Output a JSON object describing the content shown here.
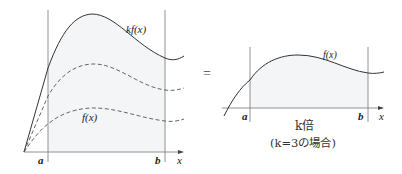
{
  "diagram": {
    "left": {
      "curve_top_label": "kf(x)",
      "curve_bottom_label": "f(x)",
      "a_label": "a",
      "b_label": "b",
      "x_label": "x"
    },
    "equals": "=",
    "right": {
      "curve_label": "f(x)",
      "a_label": "a",
      "b_label": "b",
      "x_label": "x",
      "caption_line1": "k倍",
      "caption_line2": "(k=3の場合)"
    },
    "colors": {
      "line": "#333333",
      "fill": "#f4f6f8",
      "axis": "#666666"
    }
  }
}
